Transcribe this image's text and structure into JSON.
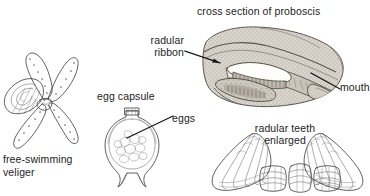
{
  "figure": {
    "title_present": false,
    "background_color": "#ffffff",
    "ink_color": "#3a3a3a",
    "text_color": "#232323",
    "panels": [
      {
        "id": "veliger",
        "name": "free-swimming-veliger",
        "caption_line1": "free-swimming",
        "caption_line2": "veliger",
        "description": "larval snail with coiled shell and four ciliated velar lobes"
      },
      {
        "id": "egg-capsule",
        "name": "egg-capsule",
        "caption": "egg capsule",
        "callout": "eggs",
        "description": "vase-shaped capsule containing rounded egg mass"
      },
      {
        "id": "proboscis",
        "name": "cross-section-of-proboscis",
        "caption": "cross section of proboscis",
        "callout_1_line1": "radular",
        "callout_1_line2": "ribbon",
        "callout_2": "mouth",
        "description": "sagittal section through proboscis showing radular ribbon and mouth opening"
      },
      {
        "id": "radular-teeth",
        "name": "radular-teeth-enlarged",
        "caption_line1": "radular teeth",
        "caption_line2": "enlarged",
        "description": "two large fan-shaped lateral teeth flanking small central plates"
      }
    ]
  },
  "labels": {
    "radular_ribbon_line1": "radular",
    "radular_ribbon_line2": "ribbon",
    "cross_section": "cross section of proboscis",
    "mouth": "mouth",
    "egg_capsule": "egg capsule",
    "eggs": "eggs",
    "radular_teeth_line1": "radular teeth",
    "radular_teeth_line2": "enlarged",
    "veliger_line1": "free-swimming",
    "veliger_line2": "veliger"
  }
}
